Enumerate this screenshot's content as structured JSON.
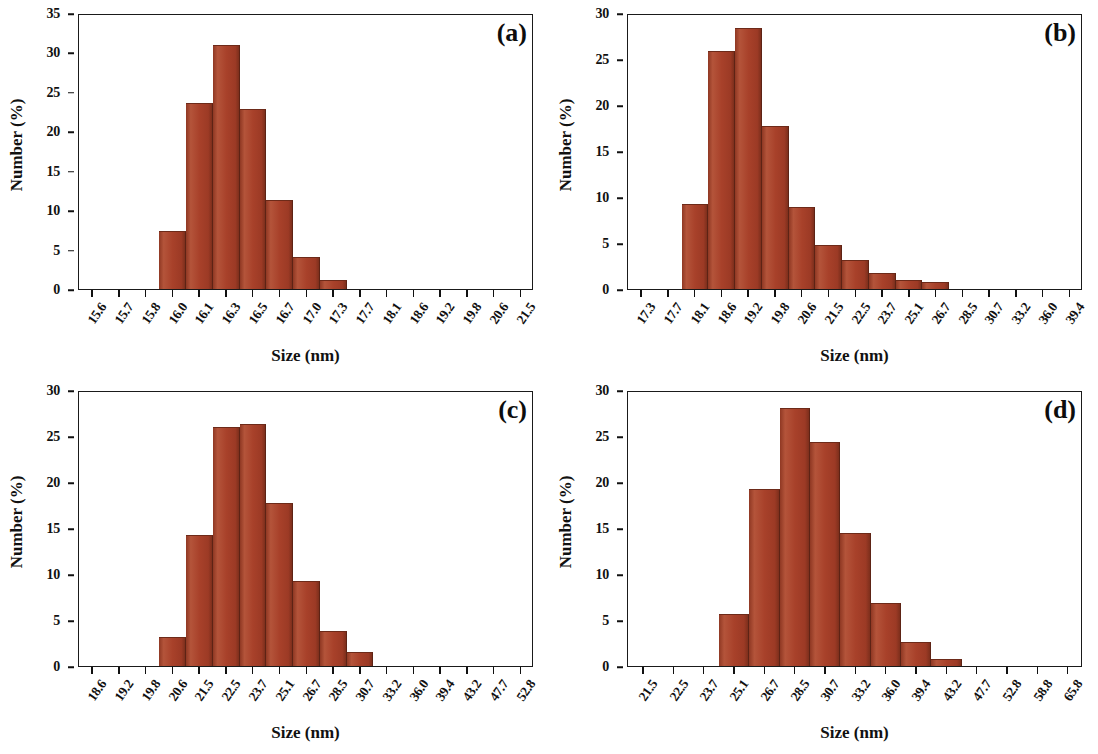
{
  "figure": {
    "type": "multi-panel-histogram",
    "panel_count": 4,
    "bar_color": "#a8412a",
    "axis_color": "#111111",
    "background": "#ffffff"
  },
  "chart_data": [
    {
      "type": "bar",
      "panel_label": "(a)",
      "title": "",
      "xlabel": "Size (nm)",
      "ylabel": "Number (%)",
      "ylim": [
        0,
        35
      ],
      "yticks": [
        0,
        5,
        10,
        15,
        20,
        25,
        30,
        35
      ],
      "grid": false,
      "legend": "none",
      "categories": [
        "15.6",
        "15.7",
        "15.8",
        "16.0",
        "16.1",
        "16.3",
        "16.5",
        "16.7",
        "17.0",
        "17.3",
        "17.7",
        "18.1",
        "18.6",
        "19.2",
        "19.8",
        "20.6",
        "21.5"
      ],
      "values": [
        0,
        0,
        0,
        7.4,
        23.6,
        31.0,
        22.8,
        11.3,
        4.1,
        1.2,
        0,
        0,
        0,
        0,
        0,
        0,
        0
      ]
    },
    {
      "type": "bar",
      "panel_label": "(b)",
      "title": "",
      "xlabel": "Size (nm)",
      "ylabel": "Number (%)",
      "ylim": [
        0,
        30
      ],
      "yticks": [
        0,
        5,
        10,
        15,
        20,
        25,
        30
      ],
      "grid": false,
      "legend": "none",
      "categories": [
        "17.3",
        "17.7",
        "18.1",
        "18.6",
        "19.2",
        "19.8",
        "20.6",
        "21.5",
        "22.5",
        "23.7",
        "25.1",
        "26.7",
        "28.5",
        "30.7",
        "33.2",
        "36.0",
        "39.4"
      ],
      "values": [
        0,
        0,
        9.2,
        25.9,
        28.4,
        17.7,
        8.9,
        4.8,
        3.1,
        1.7,
        1.0,
        0.8,
        0,
        0,
        0,
        0,
        0
      ]
    },
    {
      "type": "bar",
      "panel_label": "(c)",
      "title": "",
      "xlabel": "Size (nm)",
      "ylabel": "Number (%)",
      "ylim": [
        0,
        30
      ],
      "yticks": [
        0,
        5,
        10,
        15,
        20,
        25,
        30
      ],
      "grid": false,
      "legend": "none",
      "categories": [
        "18.6",
        "19.2",
        "19.8",
        "20.6",
        "21.5",
        "22.5",
        "23.7",
        "25.1",
        "26.7",
        "28.5",
        "30.7",
        "33.2",
        "36.0",
        "39.4",
        "43.2",
        "47.7",
        "52.8"
      ],
      "values": [
        0,
        0,
        0,
        3.2,
        14.2,
        26.0,
        26.3,
        17.7,
        9.2,
        3.8,
        1.5,
        0,
        0,
        0,
        0,
        0,
        0
      ]
    },
    {
      "type": "bar",
      "panel_label": "(d)",
      "title": "",
      "xlabel": "Size (nm)",
      "ylabel": "Number (%)",
      "ylim": [
        0,
        30
      ],
      "yticks": [
        0,
        5,
        10,
        15,
        20,
        25,
        30
      ],
      "grid": false,
      "legend": "none",
      "categories": [
        "21.5",
        "22.5",
        "23.7",
        "25.1",
        "26.7",
        "28.5",
        "30.7",
        "33.2",
        "36.0",
        "39.4",
        "43.2",
        "47.7",
        "52.8",
        "58.8",
        "65.8"
      ],
      "values": [
        0,
        0,
        0,
        5.7,
        19.2,
        28.0,
        24.3,
        14.5,
        6.8,
        2.6,
        0.8,
        0,
        0,
        0,
        0
      ]
    }
  ]
}
